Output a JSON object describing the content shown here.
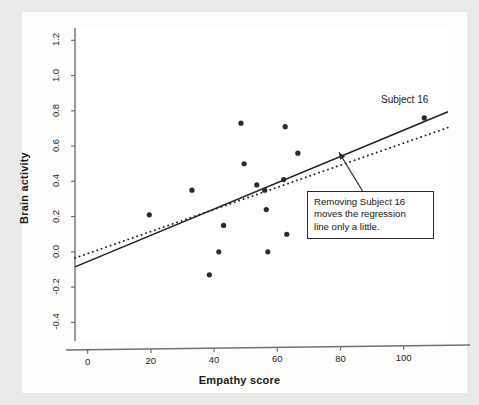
{
  "chart_data": {
    "type": "scatter",
    "title": "",
    "xlabel": "Empathy score",
    "ylabel": "Brain activity",
    "xlim": [
      -4,
      114
    ],
    "ylim": [
      -0.5,
      1.27
    ],
    "xticks": [
      0,
      20,
      40,
      60,
      80,
      100
    ],
    "xtick_labels": [
      "0",
      "20",
      "40",
      "60",
      "80",
      "100"
    ],
    "yticks": [
      -0.4,
      -0.2,
      0.0,
      0.2,
      0.4,
      0.6,
      0.8,
      1.0,
      1.2
    ],
    "ytick_labels": [
      "-0.4",
      "-0.2",
      "0.0",
      "0.2",
      "0.4",
      "0.6",
      "0.8",
      "1.0",
      "1.2"
    ],
    "grid": false,
    "legend": "none",
    "points": [
      {
        "x": 19.5,
        "y": 0.21
      },
      {
        "x": 33.0,
        "y": 0.35
      },
      {
        "x": 38.5,
        "y": -0.13
      },
      {
        "x": 41.5,
        "y": 0.0
      },
      {
        "x": 43.0,
        "y": 0.15
      },
      {
        "x": 48.5,
        "y": 0.73
      },
      {
        "x": 49.5,
        "y": 0.5
      },
      {
        "x": 53.5,
        "y": 0.38
      },
      {
        "x": 56.0,
        "y": 0.35
      },
      {
        "x": 56.5,
        "y": 0.24
      },
      {
        "x": 57.0,
        "y": 0.0
      },
      {
        "x": 62.0,
        "y": 0.41
      },
      {
        "x": 62.5,
        "y": 0.71
      },
      {
        "x": 63.0,
        "y": 0.1
      },
      {
        "x": 66.5,
        "y": 0.56
      },
      {
        "x": 106.5,
        "y": 0.76
      }
    ],
    "lines": [
      {
        "name": "regression-all-subjects",
        "style": "solid",
        "x0": -4,
        "y0": -0.085,
        "x1": 114,
        "y1": 0.795
      },
      {
        "name": "regression-without-subject-16",
        "style": "dotted",
        "x0": -4,
        "y0": -0.035,
        "x1": 114,
        "y1": 0.705
      }
    ],
    "annotations": [
      {
        "name": "subject-16-label",
        "text": "Subject 16",
        "x": 98,
        "y": 0.88
      },
      {
        "name": "callout-box",
        "lines": [
          "Removing Subject 16",
          "moves the regression",
          "line only a little."
        ],
        "arrow_from_x": 88.5,
        "arrow_from_y": 0.3,
        "arrow_to_x": 79.5,
        "arrow_to_y": 0.565
      }
    ],
    "colors": {
      "point": "#2a2a2a",
      "line": "#1f1f1f",
      "axis": "#6f6f6f",
      "plot_background": "#ffffff",
      "card_background": "#fdfdfc",
      "page_background": "#e9e9e7",
      "text": "#1a1a1a"
    }
  }
}
